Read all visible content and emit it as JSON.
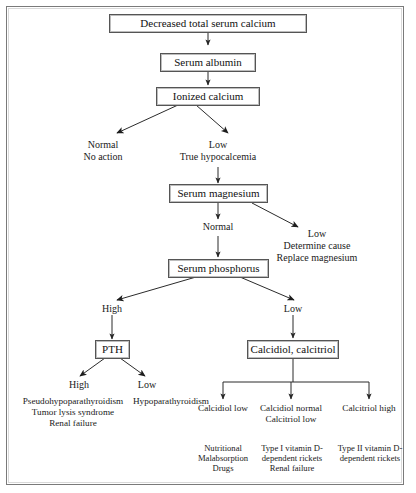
{
  "diagram": {
    "frame_color": "#7a7a7a",
    "text_color": "#1a1a1a",
    "background": "#ffffff"
  },
  "nodes": {
    "decreased_total_serum_calcium": "Decreased total serum calcium",
    "serum_albumin": "Serum albumin",
    "ionized_calcium": "Ionized calcium",
    "serum_magnesium": "Serum magnesium",
    "serum_phosphorus": "Serum phosphorus",
    "pth": "PTH",
    "calcidiol_calcitriol": "Calcidiol, calcitriol"
  },
  "labels": {
    "normal_no_action": "Normal\nNo action",
    "low_true_hypocalcemia": "Low\nTrue hypocalcemia",
    "magnesium_normal": "Normal",
    "magnesium_low": "Low\nDetermine cause\nReplace magnesium",
    "phosphorus_high": "High",
    "phosphorus_low": "Low",
    "pth_high": "High",
    "pth_low": "Low",
    "pth_high_causes": "Pseudohypoparathyroidism\nTumor lysis syndrome\nRenal failure",
    "pth_low_causes": "Hypoparathyroidism",
    "calcidiol_low": "Calcidiol low",
    "calcidiol_normal_calcitriol_low": "Calcidiol normal\nCalcitriol low",
    "calcitriol_high": "Calcitriol high",
    "calcidiol_low_causes": "Nutritional\nMalabsorption\nDrugs",
    "calcidiol_normal_causes": "Type I vitamin D-\ndependent rickets\nRenal failure",
    "calcitriol_high_causes": "Type II vitamin D-\ndependent rickets"
  }
}
